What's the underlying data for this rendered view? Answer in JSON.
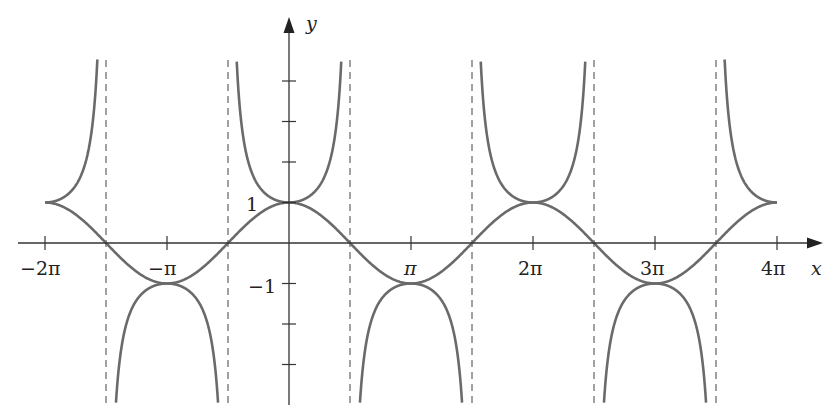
{
  "caption": "",
  "chart_data": {
    "type": "line",
    "title": "",
    "xlabel": "x",
    "ylabel": "y",
    "xlim": [
      -6.2832,
      12.5664
    ],
    "ylim": [
      -4,
      5.5
    ],
    "grid": false,
    "legend": null,
    "x_tick_labels": [
      "−2π",
      "−π",
      "π",
      "2π",
      "3π",
      "4π"
    ],
    "x_tick_values": [
      -6.2832,
      -3.1416,
      3.1416,
      6.2832,
      9.4248,
      12.5664
    ],
    "y_tick_labels": [
      "1",
      "−1"
    ],
    "y_tick_values": [
      -3,
      -2,
      -1,
      1,
      2,
      3,
      4
    ],
    "series": [
      {
        "name": "y = cos x",
        "style": "solid",
        "function": "cos",
        "points": [
          [
            -6.2832,
            1
          ],
          [
            -4.7124,
            0
          ],
          [
            -3.1416,
            -1
          ],
          [
            -1.5708,
            0
          ],
          [
            0,
            1
          ],
          [
            1.5708,
            0
          ],
          [
            3.1416,
            -1
          ],
          [
            4.7124,
            0
          ],
          [
            6.2832,
            1
          ],
          [
            7.854,
            0
          ],
          [
            9.4248,
            -1
          ],
          [
            10.9956,
            0
          ],
          [
            12.5664,
            1
          ]
        ]
      },
      {
        "name": "y = sec x",
        "style": "solid",
        "function": "sec",
        "points": [
          [
            -6.2832,
            1
          ],
          [
            -3.1416,
            -1
          ],
          [
            0,
            1
          ],
          [
            3.1416,
            -1
          ],
          [
            6.2832,
            1
          ],
          [
            9.4248,
            -1
          ],
          [
            12.5664,
            1
          ]
        ]
      }
    ],
    "asymptotes": {
      "style": "dashed",
      "x": [
        -4.7124,
        -1.5708,
        1.5708,
        4.7124,
        7.854,
        10.9956
      ]
    }
  },
  "labels": {
    "x_axis": "x",
    "y_axis": "y",
    "one": "1",
    "neg_one": "−1",
    "neg_two_pi": "−2π",
    "neg_pi": "−π",
    "pi": "π",
    "two_pi": "2π",
    "three_pi": "3π",
    "four_pi": "4π"
  },
  "colors": {
    "curve": "#6a6a6a",
    "axis": "#333333",
    "asymptote": "#555555"
  }
}
